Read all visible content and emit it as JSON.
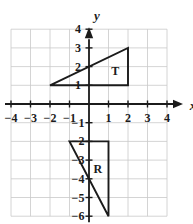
{
  "chart_data": {
    "type": "scatter",
    "title": "",
    "xlabel": "x",
    "ylabel": "y",
    "xlim": [
      -4,
      4
    ],
    "ylim": [
      -6,
      4
    ],
    "grid": true,
    "legend": "none",
    "x_ticks": [
      -4,
      -3,
      -2,
      -1,
      1,
      2,
      3,
      4
    ],
    "y_ticks": [
      4,
      3,
      2,
      1,
      -1,
      -2,
      -3,
      -4,
      -5,
      -6
    ],
    "x_tick_labels": [
      "−4",
      "−3",
      "−2",
      "−1",
      "1",
      "2",
      "3",
      "4"
    ],
    "y_tick_labels": [
      "4",
      "3",
      "2",
      "1",
      "−1",
      "−2",
      "−3",
      "−4",
      "−5",
      "−6"
    ],
    "shapes": [
      {
        "name": "T",
        "label": "T",
        "type": "triangle",
        "vertices": [
          [
            -2,
            1
          ],
          [
            2,
            1
          ],
          [
            2,
            3
          ]
        ],
        "label_at": [
          1.35,
          1.75
        ]
      },
      {
        "name": "R",
        "label": "R",
        "type": "triangle",
        "vertices": [
          [
            -1,
            -2
          ],
          [
            1,
            -2
          ],
          [
            1,
            -6
          ]
        ],
        "label_at": [
          0.45,
          -3.45
        ]
      }
    ],
    "axis_color": "#1b1b1b",
    "grid_color": "#c9c9c9",
    "shape_color": "#1b1b1b"
  },
  "axes": {
    "x_name": "x",
    "y_name": "y"
  }
}
